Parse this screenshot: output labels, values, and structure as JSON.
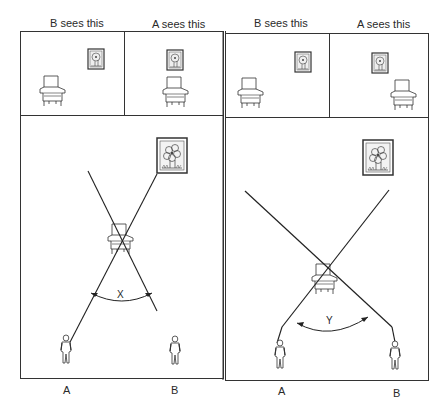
{
  "figure": {
    "left_panel": {
      "view_labels": [
        "B sees this",
        "A sees this"
      ],
      "angle_label": "X",
      "observers": [
        "A",
        "B"
      ]
    },
    "right_panel": {
      "view_labels": [
        "B sees this",
        "A sees this"
      ],
      "angle_label": "Y",
      "observers": [
        "A",
        "B"
      ]
    }
  }
}
